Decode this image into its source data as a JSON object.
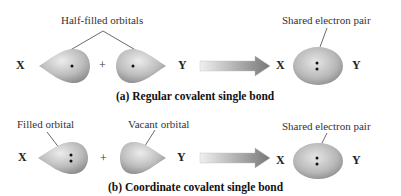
{
  "panel_a": {
    "caption": "(a) Regular covalent single bond",
    "label_left": "Half-filled orbitals",
    "label_right": "Shared electron pair",
    "atom_x": "X",
    "atom_y": "Y",
    "plus": "+",
    "product_atom_x": "X",
    "product_atom_y": "Y",
    "left_orbital_electrons": "•",
    "right_orbital_electrons": "•",
    "product_electrons": ":"
  },
  "panel_b": {
    "caption": "(b) Coordinate covalent single bond",
    "label_filled": "Filled orbital",
    "label_vacant": "Vacant orbital",
    "label_right": "Shared electron pair",
    "atom_x": "X",
    "atom_y": "Y",
    "plus": "+",
    "product_atom_x": "X",
    "product_atom_y": "Y",
    "left_orbital_electrons": ":",
    "right_orbital_electrons": "",
    "product_electrons": ":"
  },
  "colors": {
    "orbital_light": "#e4e4e4",
    "orbital_dark": "#8c8c8c",
    "arrow_light": "#e0e0e0",
    "arrow_dark": "#7a7a7a",
    "leader_line": "#444444"
  }
}
